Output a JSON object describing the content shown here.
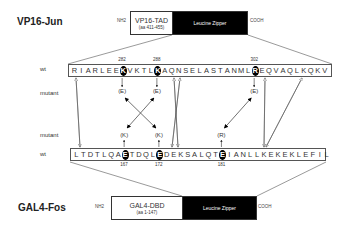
{
  "top_construct": {
    "name": "VP16-Jun",
    "n_term": "NH2",
    "c_term": "COOH",
    "domain1": {
      "name": "VP16-TAD",
      "sub": "(aa 411-455)"
    },
    "domain2": {
      "name": "Leucine Zipper"
    }
  },
  "bottom_construct": {
    "name": "GAL4-Fos",
    "n_term": "NH2",
    "c_term": "COOH",
    "domain1": {
      "name": "GAL4-DBD",
      "sub": "(aa 1-147)"
    },
    "domain2": {
      "name": "Leucine Zipper"
    }
  },
  "labels": {
    "wt": "wt",
    "mutant": "mutant"
  },
  "jun_sequence": [
    "R",
    "I",
    "A",
    "R",
    "L",
    "E",
    "E",
    "K",
    "V",
    "K",
    "T",
    "L",
    "K",
    "A",
    "Q",
    "N",
    "S",
    "E",
    "L",
    "A",
    "S",
    "T",
    "A",
    "N",
    "M",
    "L",
    "R",
    "E",
    "Q",
    "V",
    "A",
    "Q",
    "L",
    "K",
    "Q",
    "K",
    "V"
  ],
  "jun_highlights": [
    {
      "index": 7,
      "number": "282",
      "mutant": "(E)"
    },
    {
      "index": 12,
      "number": "288",
      "mutant": "(E)"
    },
    {
      "index": 26,
      "number": "302",
      "mutant": "(E)"
    }
  ],
  "fos_sequence": [
    "L",
    "T",
    "D",
    "T",
    "L",
    "Q",
    "A",
    "E",
    "T",
    "D",
    "Q",
    "L",
    "E",
    "D",
    "E",
    "K",
    "S",
    "A",
    "L",
    "Q",
    "T",
    "E",
    "I",
    "A",
    "N",
    "L",
    "L",
    "K",
    "E",
    "K",
    "E",
    "K",
    "L",
    "E",
    "F",
    "I",
    "L"
  ],
  "fos_highlights": [
    {
      "index": 7,
      "number": "167",
      "mutant": "(K)"
    },
    {
      "index": 12,
      "number": "172",
      "mutant": "(K)"
    },
    {
      "index": 21,
      "number": "181",
      "mutant": "(R)"
    }
  ]
}
